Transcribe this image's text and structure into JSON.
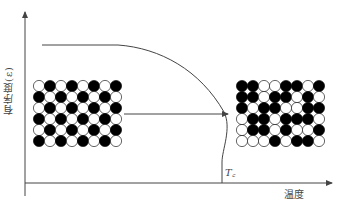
{
  "figure": {
    "y_axis_label": "有序度(ε)",
    "x_axis_label": "温度",
    "critical_temperature_label": "Tc",
    "critical_temperature_display": "T꜀",
    "curve_description": "Order parameter vs temperature: flat plateau at high order, then decreasing and dropping vertically to zero at Tc",
    "left_lattice": {
      "description": "Ordered alloy lattice (below Tc)",
      "rows": 6,
      "cols": 8,
      "pattern": "ordered-checkerboard",
      "large_atom_colors": [
        "#000000",
        "#ffffff"
      ]
    },
    "right_lattice": {
      "description": "Disordered alloy lattice (above Tc)",
      "rows": 6,
      "cols": 8,
      "pattern": "random"
    },
    "arrow_description": "Transition arrow from ordered to disordered lattice"
  },
  "colors": {
    "line": "#444444",
    "black_atom": "#000000",
    "white_atom": "#ffffff"
  }
}
